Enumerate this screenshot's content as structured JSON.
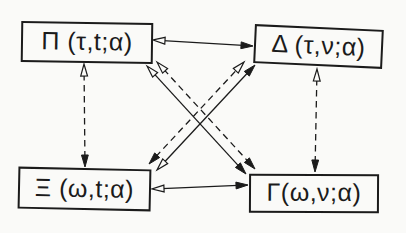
{
  "figure": {
    "background_color": "#fafaf8",
    "ink_color": "#1b1b1b",
    "nodes": [
      {
        "id": "pi",
        "label": "Π (τ,t;α)",
        "x": 21,
        "y": 22,
        "w": 132,
        "h": 41,
        "tilt": 0.8
      },
      {
        "id": "delta",
        "label": "Δ (τ,ν;α)",
        "x": 254,
        "y": 27,
        "w": 129,
        "h": 39,
        "tilt": 2.6
      },
      {
        "id": "xi",
        "label": "Ξ (ω,t;α)",
        "x": 18,
        "y": 168,
        "w": 133,
        "h": 42,
        "tilt": 1.2
      },
      {
        "id": "gamma",
        "label": "Γ(ω,ν;α)",
        "x": 249,
        "y": 174,
        "w": 130,
        "h": 39,
        "tilt": 0.3
      }
    ],
    "edges": [
      {
        "id": "pi-delta-horizontal",
        "style": "solid",
        "from": {
          "x": 153,
          "y": 40,
          "head": "open"
        },
        "to": {
          "x": 253,
          "y": 46,
          "head": "filled"
        }
      },
      {
        "id": "xi-gamma-horizontal",
        "style": "solid",
        "from": {
          "x": 152,
          "y": 189,
          "head": "open"
        },
        "to": {
          "x": 248,
          "y": 185,
          "head": "filled"
        }
      },
      {
        "id": "pi-xi-vertical",
        "style": "dashed",
        "from": {
          "x": 84,
          "y": 64,
          "head": "open"
        },
        "to": {
          "x": 85,
          "y": 167,
          "head": "filled"
        }
      },
      {
        "id": "delta-gamma-vertical",
        "style": "dashed",
        "from": {
          "x": 317,
          "y": 69,
          "head": "open"
        },
        "to": {
          "x": 315,
          "y": 172,
          "head": "filled"
        }
      },
      {
        "id": "pi-gamma-diag-solid",
        "style": "solid",
        "from": {
          "x": 147,
          "y": 66,
          "head": "open"
        },
        "to": {
          "x": 246,
          "y": 174,
          "head": "filled"
        }
      },
      {
        "id": "pi-gamma-diag-dashed",
        "style": "dashed",
        "from": {
          "x": 157,
          "y": 62,
          "head": "open"
        },
        "to": {
          "x": 255,
          "y": 169,
          "head": "filled"
        }
      },
      {
        "id": "xi-delta-diag-dashed",
        "style": "dashed",
        "from": {
          "x": 149,
          "y": 164,
          "head": "filled"
        },
        "to": {
          "x": 244,
          "y": 62,
          "head": "open"
        }
      },
      {
        "id": "xi-delta-diag-solid",
        "style": "solid",
        "from": {
          "x": 157,
          "y": 170,
          "head": "open"
        },
        "to": {
          "x": 255,
          "y": 65,
          "head": "filled"
        }
      }
    ],
    "arrowhead": {
      "length": 12,
      "halfwidth": 3.4
    },
    "line_width": 1.3,
    "dash_pattern": "6.5 4.5"
  }
}
